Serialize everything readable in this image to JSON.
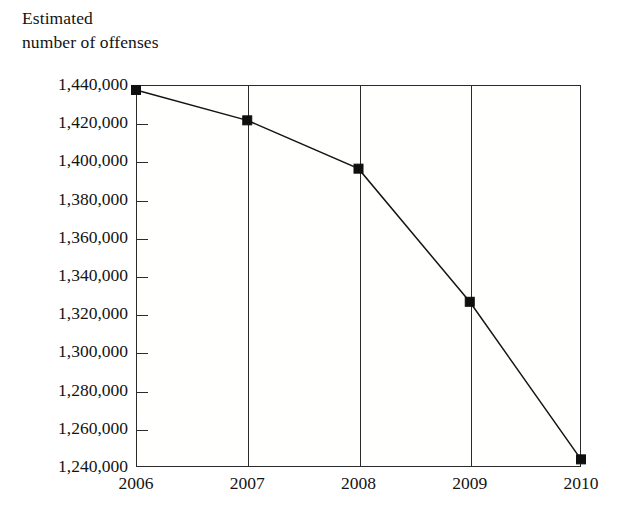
{
  "caption": {
    "line1": "Estimated",
    "line2": "number of offenses"
  },
  "chart_data": {
    "type": "line",
    "title": "",
    "subtitle": "",
    "xlabel": "",
    "ylabel": "Estimated number of offenses",
    "categories": [
      "2006",
      "2007",
      "2008",
      "2009",
      "2010"
    ],
    "x": [
      2006,
      2007,
      2008,
      2009,
      2010
    ],
    "values": [
      1437400,
      1421500,
      1396200,
      1326500,
      1244000
    ],
    "series": [
      {
        "name": "Estimated number of offenses",
        "values": [
          1437400,
          1421500,
          1396200,
          1326500,
          1244000
        ]
      }
    ],
    "ylim": [
      1240000,
      1440000
    ],
    "ytick_values": [
      1440000,
      1420000,
      1400000,
      1380000,
      1360000,
      1340000,
      1320000,
      1300000,
      1280000,
      1260000,
      1240000
    ],
    "ytick_labels": [
      "1,440,000",
      "1,420,000",
      "1,400,000",
      "1,380,000",
      "1,360,000",
      "1,340,000",
      "1,320,000",
      "1,300,000",
      "1,280,000",
      "1,260,000",
      "1,240,000"
    ],
    "xtick_labels": [
      "2006",
      "2007",
      "2008",
      "2009",
      "2010"
    ],
    "grid": "vertical",
    "legend": "none",
    "marker": "square",
    "line_color": "#141414",
    "marker_color": "#0f0f0f",
    "axis_color": "#2b2b2b",
    "background_color": "#ffffff"
  }
}
